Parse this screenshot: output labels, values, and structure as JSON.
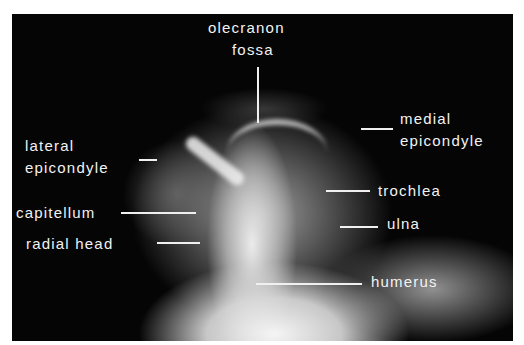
{
  "figure": {
    "type": "annotated radiograph",
    "background_color": "#050505",
    "label_color": "#f2f2f2",
    "labels": {
      "olecranon_fossa": [
        "olecranon",
        "fossa"
      ],
      "medial_epicondyle": [
        "medial",
        "epicondyle"
      ],
      "lateral_epicondyle": [
        "lateral",
        "epicondyle"
      ],
      "trochlea": "trochlea",
      "capitellum": "capitellum",
      "ulna": "ulna",
      "radial_head": "radial head",
      "humerus": "humerus"
    }
  }
}
